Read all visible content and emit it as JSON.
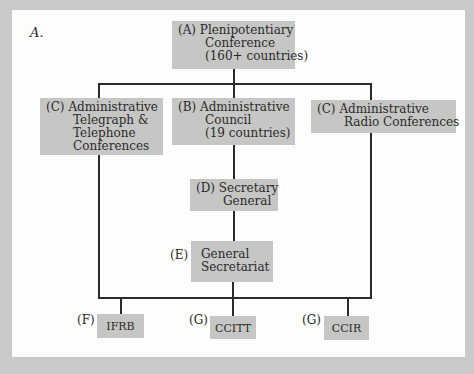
{
  "figure": {
    "label": "A."
  },
  "nodes": {
    "A": {
      "tag": "(A)",
      "lines": [
        "Plenipotentiary",
        "Conference",
        "(160+  countries)"
      ]
    },
    "C_left": {
      "tag": "(C)",
      "lines": [
        "Administrative",
        "Telegraph &",
        "Telephone",
        "Conferences"
      ]
    },
    "B": {
      "tag": "(B)",
      "lines": [
        "Administrative",
        "Council",
        "(19 countries)"
      ]
    },
    "C_right": {
      "tag": "(C)",
      "lines": [
        "Administrative",
        "Radio Conferences"
      ]
    },
    "D": {
      "tag": "(D)",
      "lines": [
        "Secretary",
        "General"
      ]
    },
    "E": {
      "tag": "(E)",
      "lines": [
        "General",
        "Secretariat"
      ]
    },
    "F": {
      "tag": "(F)",
      "lines": [
        "IFRB"
      ]
    },
    "G1": {
      "tag": "(G)",
      "lines": [
        "CCITT"
      ]
    },
    "G2": {
      "tag": "(G)",
      "lines": [
        "CCIR"
      ]
    }
  },
  "edges": [
    [
      "A",
      "C_left"
    ],
    [
      "A",
      "B"
    ],
    [
      "A",
      "C_right"
    ],
    [
      "B",
      "D"
    ],
    [
      "D",
      "E"
    ],
    [
      "C_left",
      "F"
    ],
    [
      "E",
      "G1"
    ],
    [
      "C_right",
      "G2"
    ]
  ],
  "colors": {
    "frame": "#c9c9c7",
    "panel": "#fdfdfb",
    "box": "#c6c6c4",
    "line": "#2b2b2b"
  }
}
